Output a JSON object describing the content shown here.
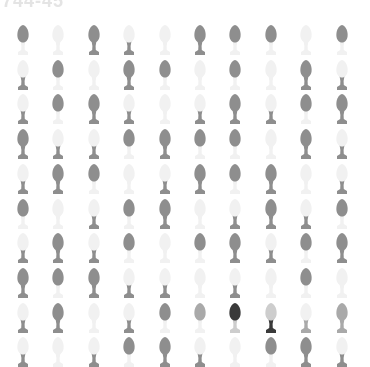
{
  "header": {
    "title": "744-45"
  },
  "colors": {
    "dark": "#8e8e8e",
    "light": "#f1f1f1",
    "medium": "#a9a9a9",
    "black": "#3a3a3a",
    "grey": "#cdcdcd"
  },
  "grid": {
    "columns": 10,
    "rows": 10,
    "x0": 15,
    "dx": 35.4,
    "y0": 24,
    "dy": 34.7,
    "legend": "each cell: [head, base] where value is a color key",
    "cells": [
      [
        [
          "dark",
          "light"
        ],
        [
          "light",
          "light"
        ],
        [
          "dark",
          "dark"
        ],
        [
          "light",
          "dark"
        ],
        [
          "light",
          "light"
        ],
        [
          "dark",
          "dark"
        ],
        [
          "dark",
          "light"
        ],
        [
          "dark",
          "light"
        ],
        [
          "light",
          "light"
        ],
        [
          "dark",
          "light"
        ]
      ],
      [
        [
          "light",
          "dark"
        ],
        [
          "dark",
          "light"
        ],
        [
          "light",
          "light"
        ],
        [
          "dark",
          "dark"
        ],
        [
          "dark",
          "light"
        ],
        [
          "light",
          "light"
        ],
        [
          "dark",
          "light"
        ],
        [
          "light",
          "light"
        ],
        [
          "dark",
          "dark"
        ],
        [
          "light",
          "dark"
        ]
      ],
      [
        [
          "light",
          "dark"
        ],
        [
          "dark",
          "light"
        ],
        [
          "dark",
          "dark"
        ],
        [
          "light",
          "dark"
        ],
        [
          "light",
          "light"
        ],
        [
          "light",
          "dark"
        ],
        [
          "dark",
          "dark"
        ],
        [
          "light",
          "dark"
        ],
        [
          "dark",
          "light"
        ],
        [
          "dark",
          "dark"
        ]
      ],
      [
        [
          "dark",
          "dark"
        ],
        [
          "light",
          "dark"
        ],
        [
          "light",
          "dark"
        ],
        [
          "dark",
          "light"
        ],
        [
          "dark",
          "dark"
        ],
        [
          "dark",
          "light"
        ],
        [
          "dark",
          "light"
        ],
        [
          "light",
          "light"
        ],
        [
          "dark",
          "dark"
        ],
        [
          "light",
          "dark"
        ]
      ],
      [
        [
          "light",
          "dark"
        ],
        [
          "dark",
          "dark"
        ],
        [
          "dark",
          "light"
        ],
        [
          "light",
          "light"
        ],
        [
          "light",
          "dark"
        ],
        [
          "dark",
          "dark"
        ],
        [
          "dark",
          "light"
        ],
        [
          "dark",
          "dark"
        ],
        [
          "light",
          "light"
        ],
        [
          "light",
          "dark"
        ]
      ],
      [
        [
          "dark",
          "light"
        ],
        [
          "light",
          "light"
        ],
        [
          "light",
          "dark"
        ],
        [
          "dark",
          "light"
        ],
        [
          "dark",
          "dark"
        ],
        [
          "light",
          "light"
        ],
        [
          "light",
          "dark"
        ],
        [
          "dark",
          "dark"
        ],
        [
          "light",
          "dark"
        ],
        [
          "dark",
          "light"
        ]
      ],
      [
        [
          "light",
          "dark"
        ],
        [
          "dark",
          "dark"
        ],
        [
          "light",
          "dark"
        ],
        [
          "dark",
          "light"
        ],
        [
          "light",
          "light"
        ],
        [
          "dark",
          "light"
        ],
        [
          "dark",
          "dark"
        ],
        [
          "light",
          "dark"
        ],
        [
          "dark",
          "light"
        ],
        [
          "dark",
          "dark"
        ]
      ],
      [
        [
          "dark",
          "dark"
        ],
        [
          "dark",
          "light"
        ],
        [
          "dark",
          "dark"
        ],
        [
          "light",
          "dark"
        ],
        [
          "light",
          "dark"
        ],
        [
          "light",
          "light"
        ],
        [
          "light",
          "dark"
        ],
        [
          "light",
          "light"
        ],
        [
          "dark",
          "light"
        ],
        [
          "light",
          "light"
        ]
      ],
      [
        [
          "light",
          "dark"
        ],
        [
          "dark",
          "dark"
        ],
        [
          "light",
          "light"
        ],
        [
          "light",
          "dark"
        ],
        [
          "dark",
          "light"
        ],
        [
          "medium",
          "light"
        ],
        [
          "black",
          "grey"
        ],
        [
          "grey",
          "black"
        ],
        [
          "light",
          "medium"
        ],
        [
          "medium",
          "medium"
        ]
      ],
      [
        [
          "light",
          "dark"
        ],
        [
          "light",
          "light"
        ],
        [
          "light",
          "dark"
        ],
        [
          "dark",
          "light"
        ],
        [
          "dark",
          "dark"
        ],
        [
          "light",
          "dark"
        ],
        [
          "light",
          "light"
        ],
        [
          "dark",
          "light"
        ],
        [
          "dark",
          "dark"
        ],
        [
          "light",
          "dark"
        ]
      ]
    ]
  }
}
